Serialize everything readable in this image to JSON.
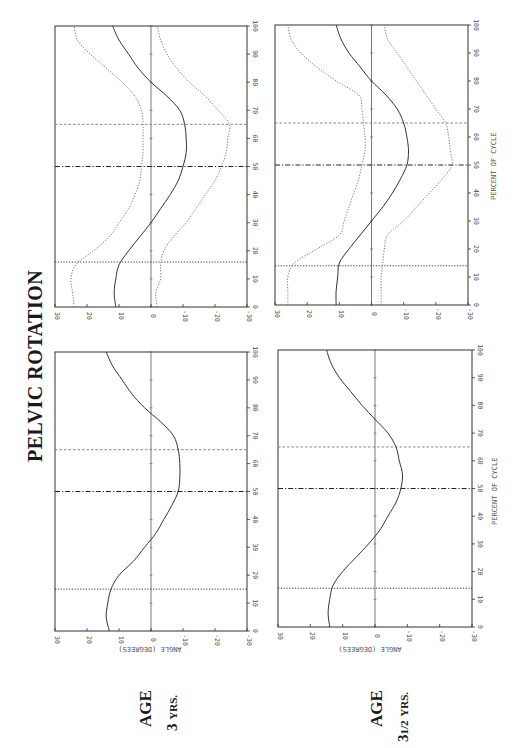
{
  "page": {
    "title": "PELVIC ROTATION",
    "columns": [
      {
        "age_label": "AGE",
        "age_value": "3",
        "age_fraction": "",
        "age_unit": "YRS."
      },
      {
        "age_label": "AGE",
        "age_value": "3",
        "age_fraction": "1/2",
        "age_unit": "YRS."
      }
    ],
    "x_axis_label": "PERCENT OF CYCLE",
    "y_axis_label": "ANGLE   (DEGREES)"
  },
  "chart_data": [
    {
      "id": "age3-sd",
      "type": "line",
      "title": "Pelvic Rotation — Age 3 yrs (mean ± SD)",
      "xlabel": "Percent of Cycle",
      "ylabel": "Angle (Degrees)",
      "xlim": [
        0,
        100
      ],
      "ylim": [
        -30,
        30
      ],
      "x_ticks": [
        0,
        10,
        20,
        30,
        40,
        50,
        60,
        70,
        80,
        90,
        100
      ],
      "y_ticks": [
        30,
        20,
        10,
        0,
        -10,
        -20,
        -30
      ],
      "x": [
        0,
        5,
        10,
        15,
        20,
        25,
        30,
        35,
        40,
        45,
        50,
        55,
        60,
        65,
        70,
        75,
        80,
        85,
        90,
        95,
        100
      ],
      "series": [
        {
          "name": "mean",
          "style": "solid",
          "values": [
            11,
            11.5,
            11,
            10,
            7,
            3.5,
            0,
            -3,
            -6,
            -8.5,
            -10,
            -11,
            -11,
            -10.5,
            -9,
            -5,
            0,
            4,
            7,
            10,
            12
          ]
        },
        {
          "name": "mean + 1 SD",
          "style": "dotted",
          "values": [
            24,
            24.5,
            25,
            23.5,
            18,
            13,
            10,
            7,
            5,
            3.5,
            3,
            2.5,
            2.5,
            2.5,
            3,
            5,
            9,
            14,
            19,
            23,
            24
          ]
        },
        {
          "name": "mean - 1 SD",
          "style": "dotted",
          "values": [
            -2,
            -1.5,
            -3,
            -3,
            -4,
            -7,
            -11,
            -14,
            -17,
            -20,
            -22,
            -23.5,
            -24,
            -24.5,
            -21,
            -17,
            -12,
            -8,
            -5,
            -3,
            -2
          ]
        }
      ],
      "vertical_markers": [
        {
          "x": 16,
          "style": "dotted"
        },
        {
          "x": 50,
          "style": "dash-dot"
        },
        {
          "x": 65,
          "style": "dashed"
        }
      ]
    },
    {
      "id": "age3-mean",
      "type": "line",
      "title": "Pelvic Rotation — Age 3 yrs (mean)",
      "xlabel": "Percent of Cycle",
      "ylabel": "Angle (Degrees)",
      "xlim": [
        0,
        100
      ],
      "ylim": [
        -30,
        30
      ],
      "x_ticks": [
        0,
        10,
        20,
        30,
        40,
        50,
        60,
        70,
        80,
        90,
        100
      ],
      "y_ticks": [
        30,
        20,
        10,
        0,
        -10,
        -20,
        -30
      ],
      "x": [
        0,
        5,
        10,
        15,
        20,
        25,
        30,
        35,
        40,
        45,
        50,
        55,
        60,
        65,
        70,
        75,
        80,
        85,
        90,
        95,
        100
      ],
      "series": [
        {
          "name": "mean",
          "style": "solid",
          "values": [
            13,
            14,
            13.5,
            12.5,
            10,
            5.5,
            2,
            -1.5,
            -4,
            -6.5,
            -8.5,
            -9,
            -9,
            -8.5,
            -7,
            -3,
            2,
            6,
            9,
            12,
            14
          ]
        }
      ],
      "vertical_markers": [
        {
          "x": 15,
          "style": "dotted"
        },
        {
          "x": 50,
          "style": "dash-dot"
        },
        {
          "x": 65,
          "style": "dashed"
        }
      ]
    },
    {
      "id": "age3half-sd",
      "type": "line",
      "title": "Pelvic Rotation — Age 3½ yrs (mean ± SD)",
      "xlabel": "Percent of Cycle",
      "ylabel": "Angle (Degrees)",
      "xlim": [
        0,
        100
      ],
      "ylim": [
        -30,
        30
      ],
      "x_ticks": [
        0,
        10,
        20,
        30,
        40,
        50,
        60,
        70,
        80,
        90,
        100
      ],
      "y_ticks": [
        30,
        20,
        10,
        0,
        -10,
        -20,
        -30
      ],
      "x": [
        0,
        5,
        10,
        15,
        20,
        25,
        30,
        35,
        40,
        45,
        50,
        55,
        60,
        65,
        70,
        75,
        80,
        85,
        90,
        95,
        100
      ],
      "series": [
        {
          "name": "mean",
          "style": "solid",
          "values": [
            11,
            11,
            10.5,
            10,
            7,
            3.5,
            0,
            -3.5,
            -6.5,
            -9,
            -11,
            -11.5,
            -11,
            -10,
            -8,
            -4.5,
            0,
            3.5,
            7,
            9.5,
            11
          ]
        },
        {
          "name": "mean + 1 SD",
          "style": "dotted",
          "values": [
            26,
            26,
            26,
            24,
            17,
            10,
            8.5,
            7,
            5.5,
            4,
            3,
            2,
            2,
            2.5,
            3,
            4,
            11,
            17,
            22,
            25,
            26
          ]
        },
        {
          "name": "mean - 1 SD",
          "style": "dotted",
          "values": [
            -3,
            -3,
            -3,
            -3.5,
            -4,
            -5,
            -10,
            -14,
            -18,
            -22,
            -25,
            -24.5,
            -24,
            -23,
            -20,
            -17,
            -14,
            -11,
            -8,
            -5,
            -4
          ]
        }
      ],
      "vertical_markers": [
        {
          "x": 14,
          "style": "dotted"
        },
        {
          "x": 50,
          "style": "dash-dot"
        },
        {
          "x": 65,
          "style": "dashed"
        }
      ]
    },
    {
      "id": "age3half-mean",
      "type": "line",
      "title": "Pelvic Rotation — Age 3½ yrs (mean)",
      "xlabel": "Percent of Cycle",
      "ylabel": "Angle (Degrees)",
      "xlim": [
        0,
        100
      ],
      "ylim": [
        -30,
        30
      ],
      "x_ticks": [
        0,
        10,
        20,
        30,
        40,
        50,
        60,
        70,
        80,
        90,
        100
      ],
      "y_ticks": [
        30,
        20,
        10,
        0,
        -10,
        -20,
        -30
      ],
      "x": [
        0,
        5,
        10,
        15,
        20,
        25,
        30,
        35,
        40,
        45,
        50,
        55,
        60,
        65,
        70,
        75,
        80,
        85,
        90,
        95,
        100
      ],
      "series": [
        {
          "name": "mean",
          "style": "solid",
          "values": [
            14,
            14.5,
            14,
            13,
            10,
            6,
            2,
            -1.5,
            -4,
            -6.5,
            -8,
            -8.5,
            -7.5,
            -6.5,
            -4,
            0,
            4,
            7.5,
            11,
            13.5,
            15
          ]
        }
      ],
      "vertical_markers": [
        {
          "x": 14,
          "style": "dotted"
        },
        {
          "x": 50,
          "style": "dash-dot"
        },
        {
          "x": 65,
          "style": "dashed"
        }
      ]
    }
  ]
}
